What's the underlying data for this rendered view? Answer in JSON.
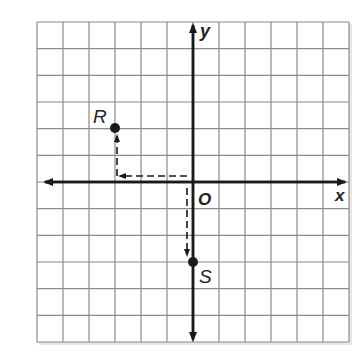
{
  "grid": {
    "cols": 12,
    "rows": 12,
    "x_min": -6,
    "x_max": 6,
    "y_min": -6,
    "y_max": 6
  },
  "axes": {
    "x_label": "x",
    "y_label": "y",
    "origin_label": "O"
  },
  "points": [
    {
      "name": "R",
      "x": -3,
      "y": 2
    },
    {
      "name": "S",
      "x": 0,
      "y": -3
    }
  ],
  "paths": [
    {
      "description": "dashed path from origin left 3 then up 2 to R"
    },
    {
      "description": "dashed path from origin down 3 to S"
    }
  ],
  "colors": {
    "grid": "#8a8a8a",
    "axis": "#1a1a1a",
    "background": "#ffffff"
  }
}
